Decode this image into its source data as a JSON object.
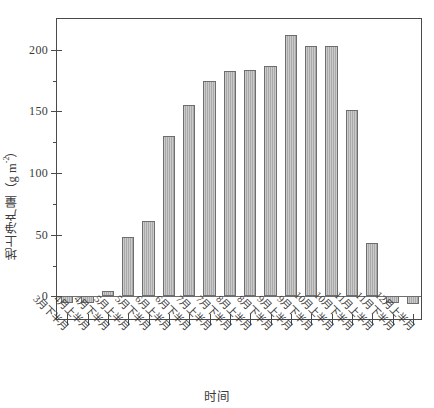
{
  "chart_data": {
    "type": "bar",
    "title": "",
    "xlabel": "时间",
    "ylabel": "地上净产量（g m-2）",
    "ylabel_parts": {
      "main": "地上净产量（g m",
      "exponent": "-2",
      "tail": "）"
    },
    "categories": [
      "3月下半月",
      "4月上半月",
      "4月下半月",
      "5月上半月",
      "5月下半月",
      "6月上半月",
      "6月下半月",
      "7月上半月",
      "7月下半月",
      "8月上半月",
      "8月下半月",
      "9月上半月",
      "9月下半月",
      "10月上半月",
      "10月下半月",
      "11月上半月",
      "11月下半月",
      "12月上半月"
    ],
    "values": [
      -5,
      -5,
      4,
      48,
      61,
      130,
      155,
      175,
      183,
      184,
      187,
      212,
      203,
      203,
      151,
      43,
      -5,
      -6
    ],
    "ylim": [
      -20,
      225
    ],
    "yticks": [
      0,
      50,
      100,
      150,
      200
    ],
    "ytick_labels": [
      "0",
      "50",
      "100",
      "150",
      "200"
    ],
    "yminor_ticks": [
      25,
      75,
      125,
      175
    ],
    "grid": false,
    "legend": false,
    "bar_color": "#a9a9a9",
    "bar_edge_color": "#6d6d6d",
    "axis_color": "#4a4a4a"
  }
}
